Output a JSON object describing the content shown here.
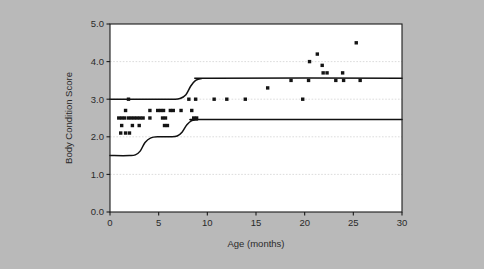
{
  "figure": {
    "background_color": "#b9b9b9",
    "plot_background_color": "#ffffff",
    "frame_color": "#1a1a1a",
    "grid_color": "#d8d8d8",
    "marker_color": "#141414",
    "curve_color": "#111111"
  },
  "chart_data": {
    "type": "scatter",
    "title": "",
    "subtitle": "",
    "xlabel": "Age (months)",
    "ylabel": "Body Condition Score",
    "xlim": [
      0,
      30
    ],
    "ylim": [
      0.0,
      5.0
    ],
    "xticks": [
      0,
      5,
      10,
      15,
      20,
      25,
      30
    ],
    "xtick_labels": [
      "0",
      "5",
      "10",
      "15",
      "20",
      "25",
      "30"
    ],
    "yticks": [
      0.0,
      1.0,
      2.0,
      3.0,
      4.0,
      5.0
    ],
    "ytick_labels": [
      "0.0",
      "1.0",
      "2.0",
      "3.0",
      "4.0",
      "5.0"
    ],
    "grid": "horizontal dotted gridlines at y = 1.0, 2.0, 3.0, 4.0",
    "legend": "none",
    "marker": "filled square",
    "points": [
      [
        1.9,
        3.0
      ],
      [
        1.6,
        2.7
      ],
      [
        4.1,
        2.7
      ],
      [
        4.9,
        2.7
      ],
      [
        5.2,
        2.7
      ],
      [
        5.5,
        2.7
      ],
      [
        6.2,
        2.7
      ],
      [
        6.5,
        2.7
      ],
      [
        7.3,
        2.7
      ],
      [
        8.4,
        2.7
      ],
      [
        0.9,
        2.5
      ],
      [
        1.2,
        2.5
      ],
      [
        1.5,
        2.5
      ],
      [
        1.9,
        2.5
      ],
      [
        2.2,
        2.5
      ],
      [
        2.5,
        2.5
      ],
      [
        2.8,
        2.5
      ],
      [
        3.1,
        2.5
      ],
      [
        3.4,
        2.5
      ],
      [
        4.1,
        2.5
      ],
      [
        5.4,
        2.5
      ],
      [
        5.7,
        2.5
      ],
      [
        1.2,
        2.3
      ],
      [
        2.3,
        2.3
      ],
      [
        3.0,
        2.3
      ],
      [
        5.6,
        2.3
      ],
      [
        5.9,
        2.3
      ],
      [
        1.1,
        2.1
      ],
      [
        1.6,
        2.1
      ],
      [
        2.0,
        2.1
      ],
      [
        8.1,
        3.0
      ],
      [
        8.8,
        3.0
      ],
      [
        10.7,
        3.0
      ],
      [
        12.0,
        3.0
      ],
      [
        13.9,
        3.0
      ],
      [
        19.8,
        3.0
      ],
      [
        16.2,
        3.3
      ],
      [
        18.6,
        3.5
      ],
      [
        20.4,
        3.5
      ],
      [
        23.2,
        3.5
      ],
      [
        24.0,
        3.5
      ],
      [
        25.7,
        3.5
      ],
      [
        20.5,
        4.0
      ],
      [
        21.3,
        4.2
      ],
      [
        21.8,
        3.9
      ],
      [
        21.9,
        3.7
      ],
      [
        22.3,
        3.7
      ],
      [
        23.9,
        3.7
      ],
      [
        25.3,
        4.5
      ],
      [
        8.6,
        2.5
      ],
      [
        8.9,
        2.5
      ]
    ],
    "curves": [
      {
        "name": "upper-reference-curve",
        "description": "Upper sigmoid reference line rising from 3.0 to approximately 3.55",
        "points": [
          [
            0.0,
            3.0
          ],
          [
            4.0,
            3.0
          ],
          [
            6.5,
            3.0
          ],
          [
            7.2,
            3.02
          ],
          [
            7.8,
            3.12
          ],
          [
            8.3,
            3.35
          ],
          [
            8.8,
            3.5
          ],
          [
            9.4,
            3.55
          ],
          [
            10.5,
            3.56
          ],
          [
            30.0,
            3.56
          ]
        ]
      },
      {
        "name": "lower-reference-curve",
        "description": "Lower stepped reference line rising from 1.5 through 2.0 to approximately 2.45",
        "points": [
          [
            0.0,
            1.5
          ],
          [
            2.0,
            1.5
          ],
          [
            2.6,
            1.52
          ],
          [
            3.1,
            1.62
          ],
          [
            3.6,
            1.85
          ],
          [
            4.2,
            1.97
          ],
          [
            5.0,
            2.0
          ],
          [
            6.2,
            2.0
          ],
          [
            6.9,
            2.02
          ],
          [
            7.4,
            2.12
          ],
          [
            7.9,
            2.32
          ],
          [
            8.4,
            2.43
          ],
          [
            9.0,
            2.45
          ],
          [
            10.0,
            2.46
          ],
          [
            30.0,
            2.46
          ]
        ]
      }
    ]
  },
  "axes": {
    "y_title": "Body Condition Score",
    "x_title": "Age (months)"
  }
}
